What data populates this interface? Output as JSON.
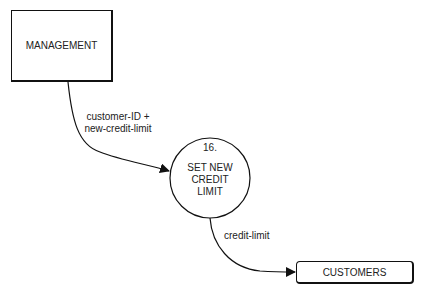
{
  "diagram": {
    "type": "data-flow-diagram",
    "external_entities": [
      {
        "id": "management",
        "label": "MANAGEMENT"
      },
      {
        "id": "customers",
        "label": "CUSTOMERS"
      }
    ],
    "processes": [
      {
        "number": "16.",
        "label_lines": [
          "SET NEW",
          "CREDIT",
          "LIMIT"
        ]
      }
    ],
    "flows": [
      {
        "from": "management",
        "to": "process-16",
        "label_lines": [
          "customer-ID +",
          "new-credit-limit"
        ]
      },
      {
        "from": "process-16",
        "to": "customers",
        "label_lines": [
          "credit-limit"
        ]
      }
    ]
  }
}
